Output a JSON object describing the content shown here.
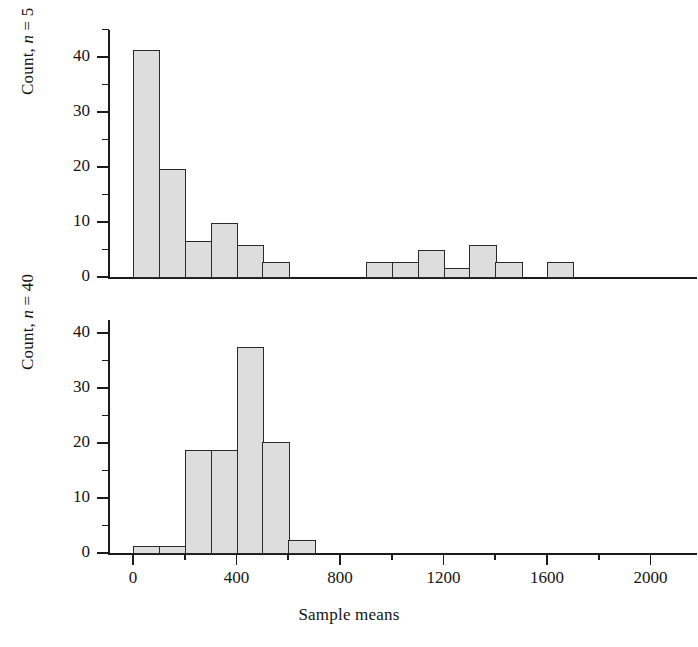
{
  "figure": {
    "width": 698,
    "height": 647,
    "background": "#ffffff",
    "bar_fill": "#dddddd",
    "bar_stroke": "#2a2a2a",
    "axis_color": "#1b1b1b",
    "cropped_caption_remnant": ""
  },
  "axes": {
    "x": {
      "label": "Sample means",
      "major_ticks": [
        0,
        400,
        800,
        1200,
        1600,
        2000
      ],
      "major_tick_labels": [
        "0",
        "400",
        "800",
        "1200",
        "1600",
        "2000"
      ],
      "minor_ticks": [
        200,
        600,
        1000,
        1400,
        1800
      ],
      "range": [
        -100,
        2100
      ]
    },
    "y_top": {
      "label_prefix": "Count, ",
      "label_italic": "n",
      "label_suffix": " = 5",
      "label_full": "Count, n = 5",
      "major_ticks": [
        0,
        10,
        20,
        30,
        40
      ],
      "major_tick_labels": [
        "0",
        "10",
        "20",
        "30",
        "40"
      ],
      "minor_ticks": [
        5,
        15,
        25,
        35,
        45
      ],
      "range": [
        0,
        46
      ]
    },
    "y_bottom": {
      "label_prefix": "Count, ",
      "label_italic": "n",
      "label_suffix": " = 40",
      "label_full": "Count, n = 40",
      "major_ticks": [
        0,
        10,
        20,
        30,
        40
      ],
      "major_tick_labels": [
        "0",
        "10",
        "20",
        "30",
        "40"
      ],
      "minor_ticks": [
        5,
        15,
        25,
        35,
        45
      ],
      "range": [
        0,
        46
      ]
    }
  },
  "chart_data": [
    {
      "type": "bar",
      "panel": "top",
      "title": "",
      "xlabel": "Sample means",
      "ylabel": "Count, n = 5",
      "xlim": [
        -100,
        2100
      ],
      "ylim": [
        0,
        46
      ],
      "grid": false,
      "legend": "none",
      "bin_width": 100,
      "bins": [
        0,
        100,
        200,
        300,
        400,
        500,
        600,
        900,
        1000,
        1100,
        1200,
        1300,
        1400,
        1600
      ],
      "bin_starts": [
        0,
        100,
        200,
        300,
        400,
        500,
        900,
        1000,
        1100,
        1200,
        1300,
        1400,
        1600
      ],
      "values": [
        41.3,
        19.6,
        6.6,
        9.8,
        5.8,
        2.8,
        2.8,
        2.8,
        5.0,
        1.7,
        5.8,
        2.8,
        2.8
      ],
      "categories": [
        "0-100",
        "100-200",
        "200-300",
        "300-400",
        "400-500",
        "500-600",
        "900-1000",
        "1000-1100",
        "1100-1200",
        "1200-1300",
        "1300-1400",
        "1400-1500",
        "1600-1700"
      ]
    },
    {
      "type": "bar",
      "panel": "bottom",
      "title": "",
      "xlabel": "Sample means",
      "ylabel": "Count, n = 40",
      "xlim": [
        -100,
        2100
      ],
      "ylim": [
        0,
        46
      ],
      "grid": false,
      "legend": "none",
      "bin_width": 100,
      "bin_starts": [
        0,
        100,
        200,
        300,
        400,
        500,
        600
      ],
      "values": [
        1.3,
        1.3,
        18.8,
        18.8,
        37.5,
        20.1,
        2.4
      ],
      "categories": [
        "0-100",
        "100-200",
        "200-300",
        "300-400",
        "400-500",
        "500-600",
        "600-700"
      ]
    }
  ]
}
